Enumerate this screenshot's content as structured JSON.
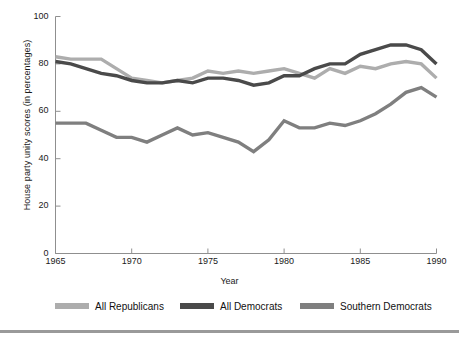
{
  "chart_data": {
    "type": "line",
    "title": "",
    "xlabel": "Year",
    "ylabel": "House party unity scores (in percentages)",
    "xlim": [
      1965,
      1990
    ],
    "ylim": [
      0,
      100
    ],
    "xticks": [
      1965,
      1970,
      1975,
      1980,
      1985,
      1990
    ],
    "yticks": [
      0,
      20,
      40,
      60,
      80,
      100
    ],
    "grid": false,
    "legend_position": "below",
    "x": [
      1965,
      1966,
      1967,
      1968,
      1969,
      1970,
      1971,
      1972,
      1973,
      1974,
      1975,
      1976,
      1977,
      1978,
      1979,
      1980,
      1981,
      1982,
      1983,
      1984,
      1985,
      1986,
      1987,
      1988,
      1989,
      1990
    ],
    "series": [
      {
        "name": "All Republicans",
        "color": "#adadad",
        "values": [
          83,
          82,
          82,
          82,
          78,
          74,
          73,
          72,
          73,
          74,
          77,
          76,
          77,
          76,
          77,
          78,
          76,
          74,
          78,
          76,
          79,
          78,
          80,
          81,
          80,
          74
        ]
      },
      {
        "name": "All Democrats",
        "color": "#4a4a4a",
        "values": [
          81,
          80,
          78,
          76,
          75,
          73,
          72,
          72,
          73,
          72,
          74,
          74,
          73,
          71,
          72,
          75,
          75,
          78,
          80,
          80,
          84,
          86,
          88,
          88,
          86,
          80
        ]
      },
      {
        "name": "Southern Democrats",
        "color": "#7f7f7f",
        "values": [
          55,
          55,
          55,
          52,
          49,
          49,
          47,
          50,
          53,
          50,
          51,
          49,
          47,
          43,
          48,
          56,
          53,
          53,
          55,
          54,
          56,
          59,
          63,
          68,
          70,
          66
        ]
      }
    ]
  },
  "axis": {
    "ytick_labels": [
      "100",
      "80",
      "60",
      "40",
      "20",
      "0"
    ],
    "xtick_labels": [
      "1965",
      "1970",
      "1975",
      "1980",
      "1985",
      "1990"
    ],
    "xlabel": "Year",
    "ylabel": "House party unity scores (in percentages)"
  },
  "legend": {
    "entries": [
      {
        "label": "All Republicans",
        "color": "#adadad"
      },
      {
        "label": "All Democrats",
        "color": "#4a4a4a"
      },
      {
        "label": "Southern Democrats",
        "color": "#7f7f7f"
      }
    ]
  }
}
